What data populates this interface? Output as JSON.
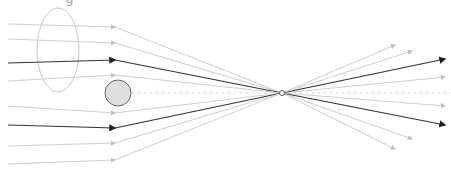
{
  "diagram": {
    "title_fragment": "g",
    "width": 451,
    "height": 175,
    "colors": {
      "light_ray": "#c8c8c8",
      "dark_ray": "#333333",
      "ellipse_stroke": "#cccccc",
      "circle_fill": "#dedede",
      "circle_stroke": "#666666",
      "axis": "#d0d0d0",
      "focal_fill": "#ffffff",
      "focal_stroke": "#555555"
    },
    "focal_point": {
      "x": 282,
      "y": 93,
      "r": 2.5
    },
    "ellipse": {
      "cx": 58,
      "cy": 50,
      "rx": 21,
      "ry": 42
    },
    "obstacle_circle": {
      "cx": 118,
      "cy": 93,
      "r": 13
    },
    "optical_axis": {
      "x1": 132,
      "y1": 93,
      "x2": 451,
      "y2": 93,
      "dashed": true
    },
    "rays": [
      {
        "start": [
          8,
          24
        ],
        "mid": [
          115,
          27
        ],
        "end": [
          395,
          149
        ],
        "dark": false
      },
      {
        "start": [
          8,
          39
        ],
        "mid": [
          115,
          43
        ],
        "end": [
          412,
          139
        ],
        "dark": false
      },
      {
        "start": [
          8,
          63
        ],
        "mid": [
          115,
          60
        ],
        "end": [
          445,
          125
        ],
        "dark": true
      },
      {
        "start": [
          8,
          81
        ],
        "mid": [
          115,
          75
        ],
        "end": [
          445,
          106
        ],
        "dark": false
      },
      {
        "start": [
          8,
          106
        ],
        "mid": [
          115,
          113
        ],
        "end": [
          445,
          77
        ],
        "dark": false
      },
      {
        "start": [
          8,
          125
        ],
        "mid": [
          115,
          128
        ],
        "end": [
          445,
          59
        ],
        "dark": true
      },
      {
        "start": [
          8,
          146
        ],
        "mid": [
          115,
          143
        ],
        "end": [
          412,
          51
        ],
        "dark": false
      },
      {
        "start": [
          8,
          164
        ],
        "mid": [
          115,
          160
        ],
        "end": [
          395,
          45
        ],
        "dark": false
      }
    ]
  }
}
